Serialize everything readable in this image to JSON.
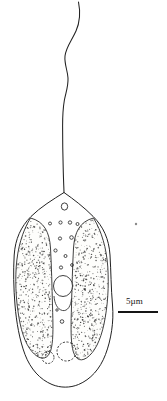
{
  "figure": {
    "type": "scientific-line-drawing",
    "background_color": "#ffffff",
    "ink_color": "#1a1a1a",
    "width": 167,
    "height": 401
  },
  "scale_bar": {
    "label": "5µm",
    "label_x": 126,
    "label_y": 297,
    "bar_x": 118,
    "bar_y": 311,
    "bar_width": 40,
    "bar_height": 2,
    "color": "#151515"
  },
  "flagellum": {
    "name": "flagellum",
    "path": "M 78.5 2 C 80.5 12, 80.0 22, 76.0 31 C 71.5 41, 66.0 47, 65.0 56 C 64.2 64, 67.5 70, 68.0 78 C 68.4 86, 66.0 92, 64.4 100 C 63.0 108, 62.6 117, 62.6 126 C 62.6 140, 62.8 154, 63.2 168 C 63.4 178, 63.8 186, 64.0 192.5",
    "stroke": "#222222",
    "stroke_width": 1.05
  },
  "cell_body": {
    "name": "cell-outline",
    "path": "M 64.0 192.5 C 53.0 199.5, 40.5 207.0, 31.0 216.5 C 21.0 226.5, 15.2 239.0, 14.2 255.0 C 13.2 271.0, 13.6 288.0, 15.0 305.0 C 16.4 322.0, 19.5 340.0, 25.0 354.5 C 30.5 369.0, 40.0 379.5, 52.0 384.5 C 60.5 388.0, 70.0 388.0, 78.5 384.5 C 90.5 379.5, 100.0 369.0, 105.5 354.5 C 111.0 340.0, 114.0 322.0, 112.5 305.0 C 111.0 288.0, 111.0 271.0, 110.0 255.0 C 109.0 239.0, 103.2 226.5, 93.2 216.5 C 83.7 207.0, 74.0 199.5, 64.0 192.5 Z",
    "stroke": "#222222",
    "stroke_width": 1.0,
    "fill": "#ffffff"
  },
  "chloroplast_left": {
    "name": "chloroplast-left-lobe",
    "path": "M 30.5 218.0 C 22.5 231.0, 17.5 248.0, 16.2 267.0 C 15.0 286.0, 16.4 306.0, 20.2 324.0 C 23.6 340.0, 29.5 351.5, 37.5 356.5 C 44.5 360.5, 49.5 357.0, 51.5 347.5 C 53.5 338.0, 53.0 323.0, 52.5 306.0 C 52.0 287.0, 51.5 266.0, 50.5 248.0 C 49.5 232.0, 44.0 221.5, 30.5 218.0 Z",
    "stroke": "#2a2a2a",
    "stroke_width": 0.9,
    "fill": "#fdfdfb",
    "stipple_seed": 1107,
    "stipple_count": 640
  },
  "chloroplast_right": {
    "name": "chloroplast-right-lobe",
    "path": "M 93.5 218.0 C 101.5 231.0, 106.5 248.0, 107.8 267.0 C 109.0 286.0, 107.8 306.0, 104.0 324.0 C 100.6 340.0, 94.8 352.5, 86.5 358.0 C 79.5 362.5, 74.5 358.5, 72.5 348.5 C 70.5 338.5, 71.0 323.0, 71.5 306.0 C 72.0 287.0, 72.5 266.0, 73.5 248.0 C 74.5 232.0, 80.0 221.5, 93.5 218.0 Z",
    "stroke": "#2a2a2a",
    "stroke_width": 0.9,
    "fill": "#fdfdfb",
    "stipple_seed": 2213,
    "stipple_count": 660
  },
  "nucleus": {
    "name": "nucleus",
    "cx": 63.0,
    "cy": 286.0,
    "rx": 9.5,
    "ry": 10.5,
    "stroke": "#2a2a2a",
    "stroke_width": 0.9,
    "fill": "#ffffff"
  },
  "nucleus_lower_lobe": {
    "name": "pyrenoid",
    "path": "M 54.0 296.0 C 54.5 303.5, 57.5 309.5, 62.5 310.5 C 67.5 311.5, 71.0 306.0, 71.5 298.5",
    "stroke": "#2a2a2a",
    "stroke_width": 0.85
  },
  "vacuoles": [
    {
      "name": "vacuole-small",
      "cx": 48.0,
      "cy": 357.5,
      "rx": 6.0,
      "ry": 6.0,
      "stroke": "#2a2a2a",
      "stroke_width": 0.9,
      "dash": "2 1.4"
    },
    {
      "name": "vacuole-large",
      "cx": 66.5,
      "cy": 351.5,
      "rx": 9.5,
      "ry": 9.5,
      "stroke": "#2a2a2a",
      "stroke_width": 0.9,
      "dash": "2.2 1.5"
    }
  ],
  "apical_organelle": {
    "name": "apical-organelle",
    "cx": 64.5,
    "cy": 206.5,
    "rx": 3.2,
    "ry": 3.6,
    "stroke": "#2a2a2a",
    "stroke_width": 0.9
  },
  "cytoplasm_granules": [
    {
      "name": "granule",
      "cx": 50.0,
      "cy": 223.5,
      "r": 1.5
    },
    {
      "name": "granule",
      "cx": 60.5,
      "cy": 222.5,
      "r": 1.6
    },
    {
      "name": "granule",
      "cx": 70.0,
      "cy": 222.5,
      "r": 1.7
    },
    {
      "name": "granule",
      "cx": 77.5,
      "cy": 224.0,
      "r": 1.5
    },
    {
      "name": "granule",
      "cx": 60.0,
      "cy": 238.5,
      "r": 1.6
    },
    {
      "name": "granule",
      "cx": 71.5,
      "cy": 237.5,
      "r": 1.8
    },
    {
      "name": "granule",
      "cx": 55.5,
      "cy": 250.5,
      "r": 1.6
    },
    {
      "name": "granule",
      "cx": 65.5,
      "cy": 256.0,
      "r": 1.5
    },
    {
      "name": "granule",
      "cx": 61.0,
      "cy": 267.5,
      "r": 1.6
    },
    {
      "name": "granule",
      "cx": 72.0,
      "cy": 265.0,
      "r": 1.4
    },
    {
      "name": "granule",
      "cx": 62.0,
      "cy": 321.5,
      "r": 1.8
    },
    {
      "name": "granule",
      "cx": 57.0,
      "cy": 310.0,
      "r": 1.2
    }
  ],
  "stray_speck": {
    "name": "stray-speck",
    "cx": 136.0,
    "cy": 224.0,
    "r": 1.2,
    "color": "#8a8a8a"
  }
}
